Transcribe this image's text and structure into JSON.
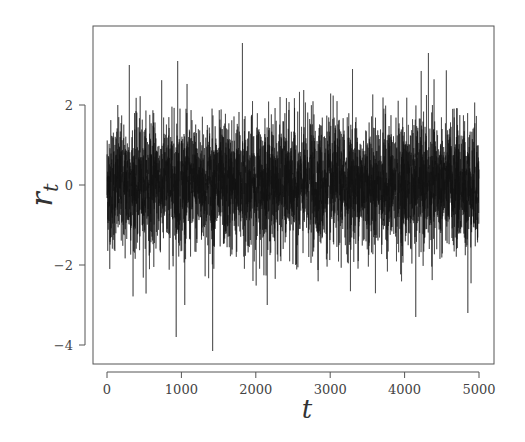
{
  "chart_data": {
    "type": "line",
    "title": "",
    "xlabel": "t",
    "ylabel": "r_t",
    "ylabel_main": "r",
    "ylabel_sub": "t",
    "x_range": [
      0,
      5000
    ],
    "xlim": [
      -350,
      5200
    ],
    "ylim": [
      -4.4,
      3.9
    ],
    "x_ticks": [
      0,
      1000,
      2000,
      3000,
      4000,
      5000
    ],
    "x_tick_labels": [
      "0",
      "1000",
      "2000",
      "3000",
      "4000",
      "5000"
    ],
    "y_ticks": [
      -4,
      -2,
      0,
      2
    ],
    "y_tick_labels": [
      "−4",
      "−2",
      "0",
      "2"
    ],
    "grid": false,
    "legend": null,
    "series": [
      {
        "name": "r_t",
        "n_points": 5000,
        "description": "stationary noise-like return series centered at 0, approx standard deviation 0.8",
        "mean": 0.0,
        "std": 0.8,
        "color": "#111111",
        "notable_points": [
          {
            "t": 1820,
            "value": 3.55
          },
          {
            "t": 300,
            "value": 3.0
          },
          {
            "t": 950,
            "value": 3.1
          },
          {
            "t": 3300,
            "value": 2.9
          },
          {
            "t": 4320,
            "value": 3.3
          },
          {
            "t": 930,
            "value": -3.8
          },
          {
            "t": 1420,
            "value": -4.15
          },
          {
            "t": 4150,
            "value": -3.3
          },
          {
            "t": 4850,
            "value": -3.2
          }
        ]
      }
    ]
  },
  "style": {
    "line_color": "#111111",
    "frame_color": "#555555",
    "background": "#ffffff"
  }
}
